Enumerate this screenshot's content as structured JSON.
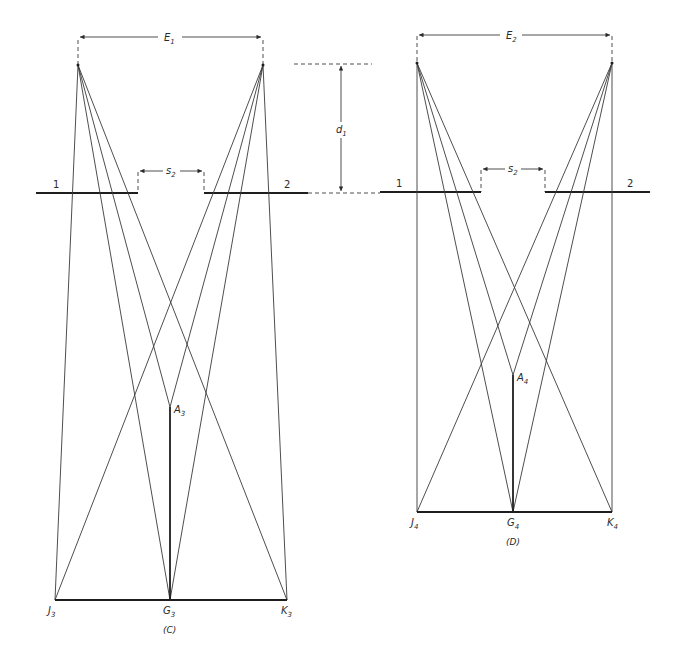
{
  "figure": {
    "type": "geometric stereo viewing construction",
    "panels": [
      {
        "id": "C",
        "caption": "(C)",
        "eye_separation_label": {
          "main": "E",
          "sub": "1"
        },
        "gap_label": {
          "main": "s",
          "sub": "2"
        },
        "plane_labels": [
          "1",
          "2"
        ],
        "points": {
          "J": {
            "main": "J",
            "sub": "3"
          },
          "G": {
            "main": "G",
            "sub": "3"
          },
          "K": {
            "main": "K",
            "sub": "3"
          },
          "A": {
            "main": "A",
            "sub": "3"
          }
        }
      },
      {
        "id": "D",
        "caption": "(D)",
        "eye_separation_label": {
          "main": "E",
          "sub": "2"
        },
        "gap_label": {
          "main": "s",
          "sub": "2"
        },
        "plane_labels": [
          "1",
          "2"
        ],
        "points": {
          "J": {
            "main": "J",
            "sub": "4"
          },
          "G": {
            "main": "G",
            "sub": "4"
          },
          "K": {
            "main": "K",
            "sub": "4"
          },
          "A": {
            "main": "A",
            "sub": "4"
          }
        }
      }
    ],
    "distance_label": {
      "main": "d",
      "sub": "1"
    }
  }
}
